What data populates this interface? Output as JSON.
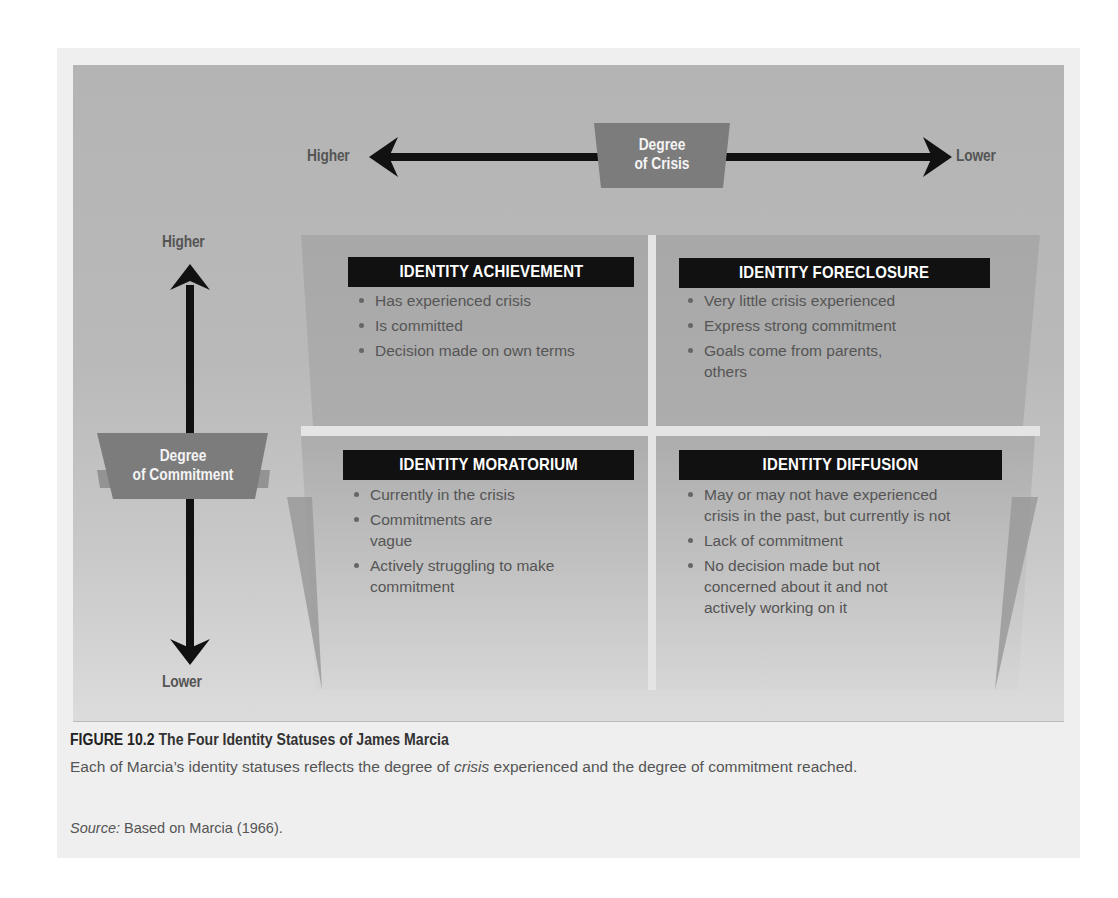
{
  "diagram": {
    "horizontal_axis": {
      "label": "Degree of Crisis",
      "label_line1": "Degree",
      "label_line2": "of Crisis",
      "left_end": "Higher",
      "right_end": "Lower"
    },
    "vertical_axis": {
      "label": "Degree of Commitment",
      "label_line1": "Degree",
      "label_line2": "of Commitment",
      "top_end": "Higher",
      "bottom_end": "Lower"
    },
    "quadrants": [
      {
        "position": "top-left",
        "title": "IDENTITY ACHIEVEMENT",
        "bullets": [
          "Has experienced crisis",
          "Is committed",
          "Decision made on own terms"
        ]
      },
      {
        "position": "top-right",
        "title": "IDENTITY FORECLOSURE",
        "bullets": [
          "Very little crisis experienced",
          "Express strong commitment",
          "Goals come from parents, others"
        ]
      },
      {
        "position": "bottom-left",
        "title": "IDENTITY MORATORIUM",
        "bullets": [
          "Currently in the crisis",
          "Commitments are vague",
          "Actively struggling to make commitment"
        ]
      },
      {
        "position": "bottom-right",
        "title": "IDENTITY DIFFUSION",
        "bullets": [
          "May or may not have experienced crisis in the past, but currently is not",
          "Lack of commitment",
          "No decision made but not concerned about it and not actively working on it"
        ]
      }
    ],
    "colors": {
      "background_gray": "#b6b6b6",
      "badge_gray": "#7c7c7c",
      "quadrant_gray": "#a9a9a9",
      "header_black": "#111111",
      "divider_light": "#e6e6e6"
    }
  },
  "caption": {
    "figure_number": "FIGURE 10.2",
    "title": "The Four Identity Statuses of James Marcia",
    "body_before": "Each of Marcia’s identity statuses reflects the degree of ",
    "body_italic": "crisis",
    "body_after": " experienced and the degree of commitment reached.",
    "source_label": "Source:",
    "source_text": " Based on Marcia (1966)."
  }
}
